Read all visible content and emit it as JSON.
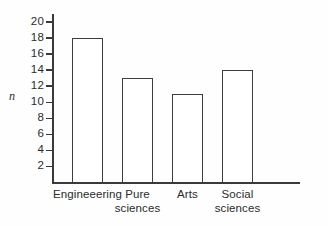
{
  "chart_data": {
    "type": "bar",
    "title": "",
    "subtitle": "",
    "xlabel": "",
    "ylabel": "n",
    "categories": [
      "Engineeering",
      "Pure sciences",
      "Arts",
      "Social sciences"
    ],
    "values": [
      18,
      13,
      11,
      14
    ],
    "ylim": [
      0,
      21
    ],
    "yticks": [
      2,
      4,
      6,
      8,
      10,
      12,
      14,
      16,
      18,
      20
    ],
    "ytick_labels": [
      "2",
      "4",
      "6",
      "8",
      "10",
      "12",
      "14",
      "16",
      "18",
      "20"
    ],
    "grid": false,
    "legend": null,
    "legend_position": "none",
    "annotations": [],
    "bar_fill_color": "#ffffff",
    "bar_edge_color": "#3d3d3d",
    "axis_color": "#3a3a3a",
    "text_color": "#2b2b2b",
    "background_color": "#fefefe"
  },
  "category_label_lines": [
    "Engineeering",
    "Pure\nsciences",
    "Arts",
    "Social\nsciences"
  ]
}
